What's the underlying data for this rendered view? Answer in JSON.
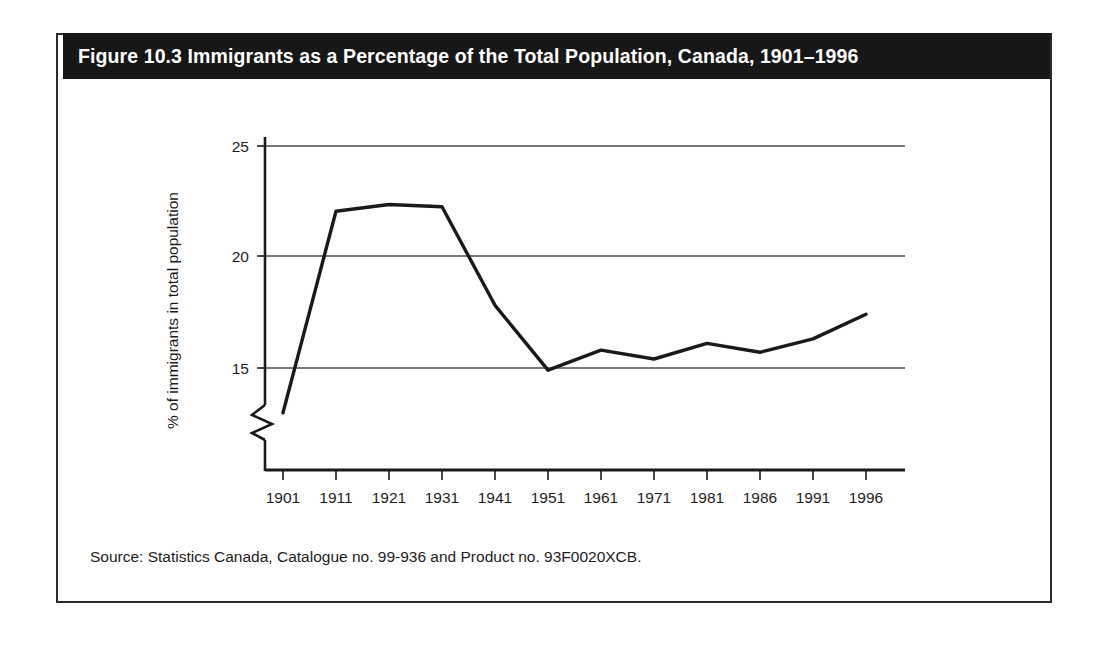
{
  "figure": {
    "title": "Figure 10.3 Immigrants as a Percentage of the Total Population, Canada, 1901–1996",
    "source": "Source: Statistics Canada, Catalogue no. 99-936 and Product no. 93F0020XCB.",
    "title_bar_color": "#171717",
    "title_text_color": "#ffffff",
    "frame_color": "#2b2b2b",
    "line_color": "#1a1a1a",
    "gridline_color": "#4d4d4d"
  },
  "chart_data": {
    "type": "line",
    "title": "Figure 10.3 Immigrants as a Percentage of the Total Population, Canada, 1901–1996",
    "xlabel": "",
    "ylabel": "% of immigrants in total population",
    "categories": [
      "1901",
      "1911",
      "1921",
      "1931",
      "1941",
      "1951",
      "1961",
      "1971",
      "1981",
      "1986",
      "1991",
      "1996"
    ],
    "values": [
      13.0,
      22.0,
      22.3,
      22.2,
      17.8,
      14.9,
      15.8,
      15.4,
      16.1,
      15.7,
      16.3,
      17.4
    ],
    "y_ticks": [
      15,
      20,
      25
    ],
    "y_tick_labels": [
      "15",
      "20",
      "25"
    ],
    "ylim": [
      12.2,
      25.6
    ],
    "axis_break": true,
    "axis_break_note": "zigzag break on y-axis below 15",
    "grid": "horizontal",
    "legend": "none",
    "series": [
      {
        "name": "% of immigrants in total population",
        "values": [
          13.0,
          22.0,
          22.3,
          22.2,
          17.8,
          14.9,
          15.8,
          15.4,
          16.1,
          15.7,
          16.3,
          17.4
        ]
      }
    ],
    "x_tick_labels": {
      "t0": "1901",
      "t1": "1911",
      "t2": "1921",
      "t3": "1931",
      "t4": "1941",
      "t5": "1951",
      "t6": "1961",
      "t7": "1971",
      "t8": "1981",
      "t9": "1986",
      "t10": "1991",
      "t11": "1996"
    },
    "y_tick_text": {
      "y15": "15",
      "y20": "20",
      "y25": "25"
    }
  }
}
